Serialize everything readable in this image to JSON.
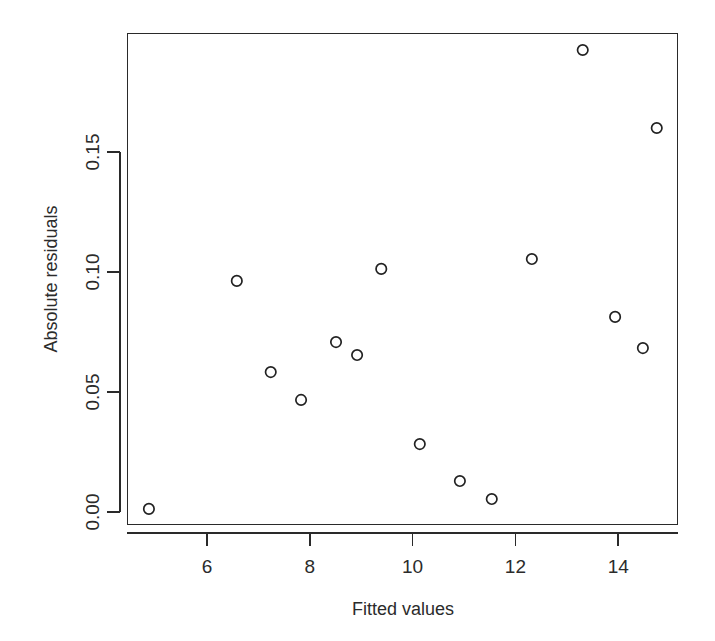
{
  "chart_data": {
    "type": "scatter",
    "title": "",
    "subtitle": "",
    "xlabel": "Fitted values",
    "ylabel": "Absolute residuals",
    "xlim": [
      4.55,
      15.2
    ],
    "ylim": [
      -0.0055,
      0.2045
    ],
    "grid": false,
    "legend": null,
    "xticks": [
      6,
      8,
      10,
      12,
      14
    ],
    "xticklabels": [
      "6",
      "8",
      "10",
      "12",
      "14"
    ],
    "yticks": [
      0.0,
      0.05,
      0.1,
      0.15
    ],
    "yticklabels": [
      "0.00",
      "0.05",
      "0.10",
      "0.15"
    ],
    "marker": "open-circle",
    "marker_color": "#222222",
    "series": [
      {
        "name": "residuals",
        "points": [
          {
            "x": 4.87,
            "y": 0.0013
          },
          {
            "x": 6.58,
            "y": 0.0963
          },
          {
            "x": 7.24,
            "y": 0.0583
          },
          {
            "x": 7.83,
            "y": 0.0467
          },
          {
            "x": 8.51,
            "y": 0.0708
          },
          {
            "x": 8.92,
            "y": 0.0654
          },
          {
            "x": 9.39,
            "y": 0.1013
          },
          {
            "x": 10.14,
            "y": 0.0283
          },
          {
            "x": 10.92,
            "y": 0.0129
          },
          {
            "x": 11.54,
            "y": 0.0054
          },
          {
            "x": 12.32,
            "y": 0.1054
          },
          {
            "x": 13.31,
            "y": 0.1925
          },
          {
            "x": 13.94,
            "y": 0.0813
          },
          {
            "x": 14.48,
            "y": 0.0683
          },
          {
            "x": 14.75,
            "y": 0.16
          }
        ]
      }
    ]
  },
  "axes": {
    "x_title": "Fitted values",
    "y_title": "Absolute residuals"
  }
}
